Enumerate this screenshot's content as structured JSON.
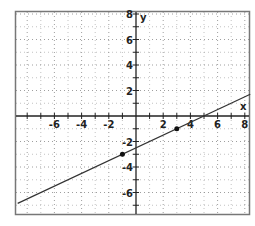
{
  "chart_data": {
    "type": "line",
    "title": "",
    "xlabel": "x",
    "ylabel": "y",
    "xlim": [
      -8.7,
      8.4
    ],
    "ylim": [
      -7.8,
      8.1
    ],
    "grid": true,
    "grid_style": "dotted",
    "x_ticks": [
      -6,
      -4,
      -2,
      2,
      4,
      6,
      8
    ],
    "y_ticks": [
      8,
      6,
      4,
      2,
      -2,
      -4,
      -6
    ],
    "x_tick_labels": [
      "-6",
      "-4",
      "-2",
      "2",
      "4",
      "6",
      "8"
    ],
    "y_tick_labels": [
      "8",
      "6",
      "4",
      "2",
      "-2",
      "-4",
      "-6"
    ],
    "series": [
      {
        "name": "line",
        "equation": "y = 0.5x - 2.5",
        "slope": 0.5,
        "intercept": -2.5,
        "x": [
          -8.7,
          8.4
        ],
        "y": [
          -6.85,
          1.7
        ]
      }
    ],
    "points": [
      {
        "x": -1,
        "y": -3
      },
      {
        "x": 3,
        "y": -1
      }
    ],
    "legend": null
  },
  "colors": {
    "line": "#333333",
    "axis": "#222222",
    "grid": "#888888",
    "frame": "#777777",
    "point": "#111111"
  }
}
